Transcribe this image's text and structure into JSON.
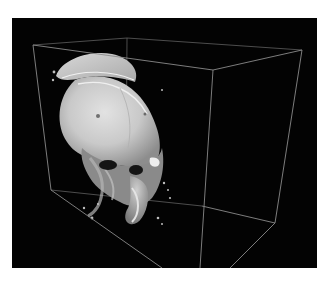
{
  "figure": {
    "background_color": "#030303",
    "page_color": "#ffffff",
    "bounding_box_color": "#8a8a8a",
    "bone_color": "#d6d6d6"
  }
}
